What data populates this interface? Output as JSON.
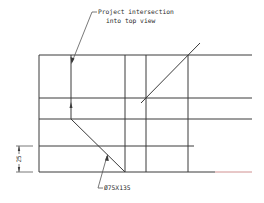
{
  "drawing": {
    "annotations": {
      "top_note_line1": "Project intersection",
      "top_note_line2": "into top view",
      "dimension_label": "25",
      "callout_label": "Ø75X135"
    },
    "colors": {
      "line": "#3a3a3a",
      "accent_line": "#d08080",
      "background": "#ffffff"
    }
  }
}
